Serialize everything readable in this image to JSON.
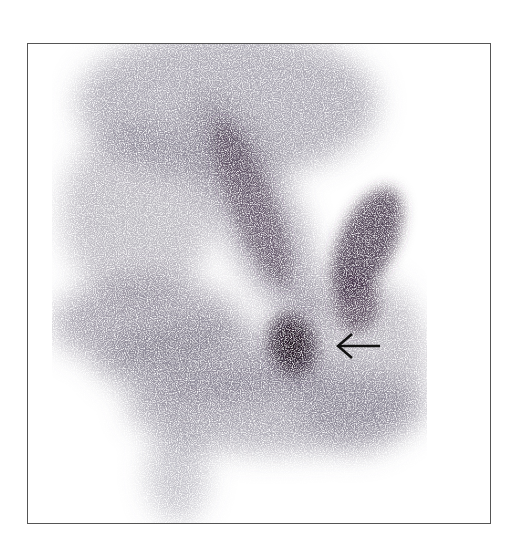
{
  "figure": {
    "type": "scintigraphy",
    "colors": {
      "background": "#ffffff",
      "frame": "#555555",
      "uptake": "#3a2a3e",
      "arrow": "#111111"
    },
    "annotations": [
      {
        "kind": "arrow",
        "direction": "left",
        "icon": "arrow-left-icon",
        "points_to": "focal-uptake"
      }
    ]
  }
}
